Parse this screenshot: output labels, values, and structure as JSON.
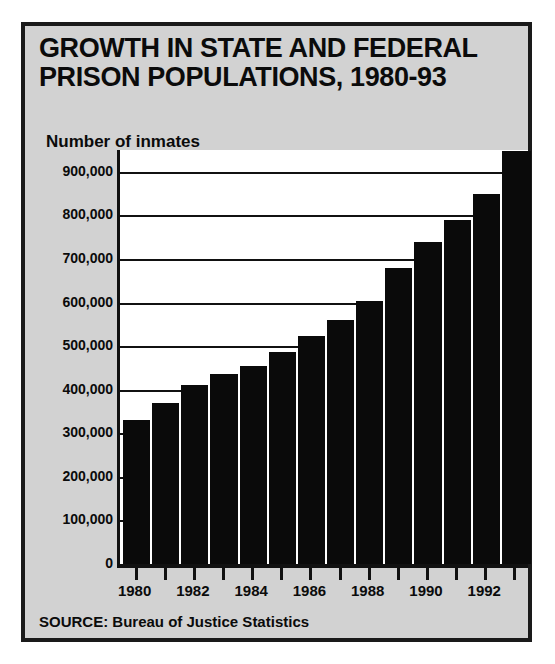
{
  "figure": {
    "title_lines": [
      "GROWTH IN STATE AND FEDERAL",
      "PRISON POPULATIONS, 1980-93"
    ],
    "source": "SOURCE: Bureau of Justice Statistics",
    "colors": {
      "panel_background": "#d2d2d2",
      "frame": "#1a1a1a",
      "plot_background": "#ffffff",
      "bar_fill": "#0a0a0a",
      "bar_separator": "#ffffff",
      "gridline": "#111111",
      "text": "#0b0b0b"
    }
  },
  "chart_data": {
    "type": "bar",
    "title": "GROWTH IN STATE AND FEDERAL PRISON POPULATIONS, 1980-93",
    "xlabel": "",
    "ylabel": "Number of inmates",
    "ylim": [
      0,
      950000
    ],
    "grid": true,
    "legend": "none",
    "categories": [
      1980,
      1981,
      1982,
      1983,
      1984,
      1985,
      1986,
      1987,
      1988,
      1989,
      1990,
      1991,
      1992,
      1993
    ],
    "values": [
      330000,
      370000,
      410000,
      437000,
      455000,
      487000,
      523000,
      560000,
      603000,
      680000,
      740000,
      790000,
      850000,
      948000
    ],
    "yticks": [
      0,
      100000,
      200000,
      300000,
      400000,
      500000,
      600000,
      700000,
      800000,
      900000
    ],
    "ytick_labels": [
      "0",
      "100,000",
      "200,000",
      "300,000",
      "400,000",
      "500,000",
      "600,000",
      "700,000",
      "800,000",
      "900,000"
    ],
    "xtick_labels": [
      "1980",
      "",
      "1982",
      "",
      "1984",
      "",
      "1986",
      "",
      "1988",
      "",
      "1990",
      "",
      "1992",
      ""
    ],
    "xtick_labels_shown": [
      "1980",
      "1982",
      "1984",
      "1986",
      "1988",
      "1990",
      "1992"
    ]
  }
}
